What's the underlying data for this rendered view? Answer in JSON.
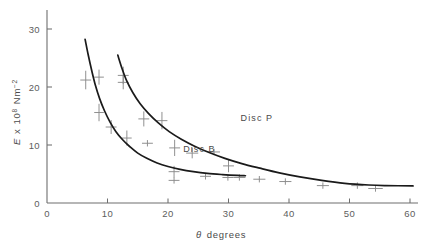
{
  "chart_data": {
    "type": "line",
    "title": "",
    "xlabel": "θ degrees",
    "ylabel": "E x 10⁸ Nm⁻²",
    "ylabel_parts": {
      "symbol": "E",
      "times": "x",
      "mantissa": "10",
      "exponent": "8",
      "unit": "Nm",
      "unit_exponent": "−2"
    },
    "xlabel_parts": {
      "symbol": "θ",
      "text": "degrees"
    },
    "xlim": [
      0,
      62
    ],
    "ylim": [
      0,
      33
    ],
    "xticks": [
      0,
      10,
      20,
      30,
      40,
      50,
      60
    ],
    "xtick_labels": [
      "0",
      "10",
      "20",
      "30",
      "40",
      "50",
      "60"
    ],
    "yticks": [
      0,
      10,
      20,
      30
    ],
    "ytick_labels": [
      "0",
      "10",
      "20",
      "30"
    ],
    "grid": false,
    "legend_position": "inline-annotations",
    "marker_style": "plus-with-error-bars",
    "series": [
      {
        "name": "Disc B",
        "label": "Disc  B",
        "label_x": 22.5,
        "label_y": 8.8,
        "curve": [
          [
            6.3,
            28.2
          ],
          [
            6.8,
            25.6
          ],
          [
            7.4,
            22.8
          ],
          [
            8.0,
            20.3
          ],
          [
            8.7,
            18.0
          ],
          [
            9.5,
            15.9
          ],
          [
            10.4,
            14.0
          ],
          [
            11.4,
            12.3
          ],
          [
            12.5,
            10.9
          ],
          [
            13.7,
            9.7
          ],
          [
            15.0,
            8.6
          ],
          [
            16.5,
            7.7
          ],
          [
            18.2,
            6.9
          ],
          [
            20.0,
            6.3
          ],
          [
            22.0,
            5.8
          ],
          [
            24.2,
            5.4
          ],
          [
            26.5,
            5.1
          ],
          [
            29.0,
            4.9
          ],
          [
            31.5,
            4.75
          ],
          [
            32.8,
            4.7
          ]
        ],
        "points": [
          {
            "x": 6.4,
            "y": 21.2,
            "yerr": 1.6,
            "xerr": 0.9
          },
          {
            "x": 8.6,
            "y": 21.7,
            "yerr": 1.3,
            "xerr": 0.8
          },
          {
            "x": 8.6,
            "y": 15.6,
            "yerr": 1.5,
            "xerr": 0.8
          },
          {
            "x": 10.6,
            "y": 13.1,
            "yerr": 1.2,
            "xerr": 0.9
          },
          {
            "x": 13.2,
            "y": 11.2,
            "yerr": 1.3,
            "xerr": 0.8
          },
          {
            "x": 16.6,
            "y": 10.3,
            "yerr": 0.0,
            "xerr": 0.9
          },
          {
            "x": 21.0,
            "y": 5.4,
            "yerr": 1.0,
            "xerr": 0.9
          },
          {
            "x": 21.0,
            "y": 3.9,
            "yerr": 0.0,
            "xerr": 0.9
          },
          {
            "x": 26.2,
            "y": 4.6,
            "yerr": 0.0,
            "xerr": 0.9
          },
          {
            "x": 29.9,
            "y": 4.4,
            "yerr": 0.0,
            "xerr": 0.9
          },
          {
            "x": 31.8,
            "y": 4.4,
            "yerr": 0.0,
            "xerr": 1.0
          }
        ]
      },
      {
        "name": "Disc P",
        "label": "Disc  P",
        "label_x": 32.0,
        "label_y": 14.2,
        "curve": [
          [
            11.7,
            25.5
          ],
          [
            12.4,
            23.2
          ],
          [
            13.2,
            21.0
          ],
          [
            14.2,
            19.0
          ],
          [
            15.4,
            17.1
          ],
          [
            16.8,
            15.4
          ],
          [
            18.4,
            13.8
          ],
          [
            20.2,
            12.3
          ],
          [
            22.2,
            11.0
          ],
          [
            24.4,
            9.8
          ],
          [
            26.8,
            8.7
          ],
          [
            29.4,
            7.7
          ],
          [
            32.2,
            6.8
          ],
          [
            35.2,
            6.0
          ],
          [
            38.4,
            5.2
          ],
          [
            41.8,
            4.5
          ],
          [
            45.4,
            3.9
          ],
          [
            49.2,
            3.4
          ],
          [
            53.2,
            3.1
          ],
          [
            56.0,
            3.0
          ],
          [
            60.5,
            2.95
          ]
        ],
        "points": [
          {
            "x": 12.6,
            "y": 22.0,
            "yerr": 1.5,
            "xerr": 0.9
          },
          {
            "x": 12.6,
            "y": 20.8,
            "yerr": 1.2,
            "xerr": 0.9
          },
          {
            "x": 16.0,
            "y": 14.5,
            "yerr": 1.3,
            "xerr": 0.9
          },
          {
            "x": 19.0,
            "y": 14.2,
            "yerr": 1.5,
            "xerr": 0.9
          },
          {
            "x": 21.1,
            "y": 9.5,
            "yerr": 1.4,
            "xerr": 0.9
          },
          {
            "x": 24.0,
            "y": 8.6,
            "yerr": 0.9,
            "xerr": 1.0
          },
          {
            "x": 27.6,
            "y": 8.8,
            "yerr": 0.0,
            "xerr": 1.0
          },
          {
            "x": 30.0,
            "y": 6.4,
            "yerr": 1.1,
            "xerr": 0.9
          },
          {
            "x": 35.1,
            "y": 4.1,
            "yerr": 0.0,
            "xerr": 1.0
          },
          {
            "x": 39.4,
            "y": 3.7,
            "yerr": 0.0,
            "xerr": 1.0
          },
          {
            "x": 45.6,
            "y": 3.0,
            "yerr": 0.0,
            "xerr": 1.0
          },
          {
            "x": 51.3,
            "y": 3.0,
            "yerr": 0.0,
            "xerr": 1.0
          },
          {
            "x": 54.3,
            "y": 2.5,
            "yerr": 0.0,
            "xerr": 1.2
          }
        ]
      }
    ]
  }
}
